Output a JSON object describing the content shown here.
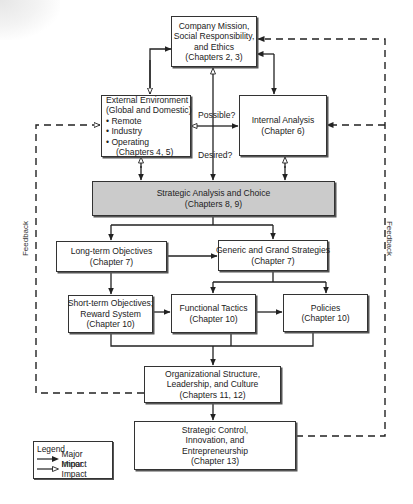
{
  "boxes": {
    "mission": [
      "Company Mission,",
      "Social Responsibility,",
      "and Ethics",
      "(Chapters 2, 3)"
    ],
    "external": [
      "External Environment",
      "(Global and Domestic)",
      "• Remote",
      "• Industry",
      "• Operating",
      "   (Chapters 4, 5)"
    ],
    "internal": [
      "Internal Analysis",
      "(Chapter 6)"
    ],
    "strategic": [
      "Strategic Analysis and Choice",
      "(Chapters 8, 9)"
    ],
    "longterm": [
      "Long-term Objectives",
      "(Chapter 7)"
    ],
    "generic": [
      "Generic and Grand Strategies",
      "(Chapter 7)"
    ],
    "shortterm": [
      "Short-term Objectives;",
      "Reward System",
      "(Chapter 10)"
    ],
    "functional": [
      "Functional Tactics",
      "(Chapter 10)"
    ],
    "policies": [
      "Policies",
      "(Chapter 10)"
    ],
    "org": [
      "Organizational Structure,",
      "Leadership, and Culture",
      "(Chapters 11, 12)"
    ],
    "control": [
      "Strategic Control,",
      "Innovation, and",
      "Entrepreneurship",
      "(Chapter 13)"
    ]
  },
  "labels": {
    "possible": "Possible?",
    "desired": "Desired?",
    "feedback_left": "Feedback",
    "feedback_right": "Feedback"
  },
  "legend": {
    "title": "Legend",
    "major": "Major Impact",
    "minor": "Minor Impact"
  },
  "colors": {
    "line": "#222222",
    "strategic_fill": "#cbcbcb",
    "box_fill": "#ffffff"
  }
}
